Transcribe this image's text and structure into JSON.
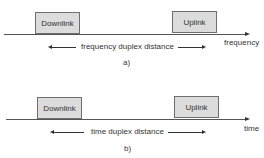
{
  "diagrams": [
    {
      "id": "a",
      "caption": "a)",
      "axis_label": "frequency",
      "blocks": [
        {
          "label": "Downlink"
        },
        {
          "label": "Uplink"
        }
      ],
      "distance_label": "frequency duplex distance"
    },
    {
      "id": "b",
      "caption": "b)",
      "axis_label": "time",
      "blocks": [
        {
          "label": "Downlink"
        },
        {
          "label": "Uplink"
        }
      ],
      "distance_label": "time duplex distance"
    }
  ]
}
